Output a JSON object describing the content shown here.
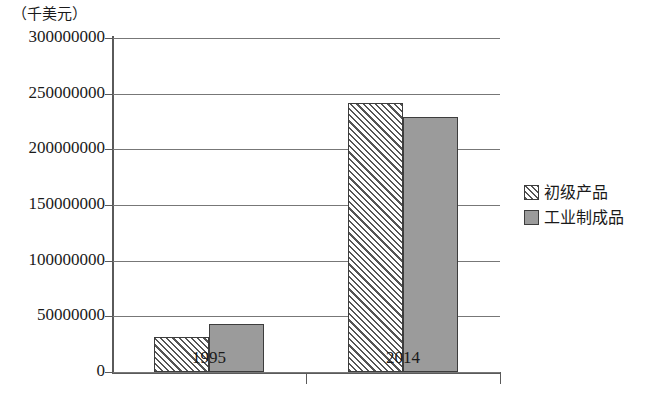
{
  "chart_data": {
    "type": "bar",
    "title": "",
    "subtitle": "",
    "unit_caption": "（千美元）",
    "xlabel": "",
    "ylabel": "",
    "categories": [
      "1995",
      "2014"
    ],
    "series": [
      {
        "name": "初级产品",
        "fill": "hatch-diagonal",
        "values": [
          31000000,
          242000000
        ]
      },
      {
        "name": "工业制成品",
        "fill": "solid-gray",
        "values": [
          43000000,
          229000000
        ]
      }
    ],
    "ylim": [
      0,
      300000000
    ],
    "ytick_values": [
      0,
      50000000,
      100000000,
      150000000,
      200000000,
      250000000,
      300000000
    ],
    "ytick_labels": [
      "0",
      "50000000",
      "100000000",
      "150000000",
      "200000000",
      "250000000",
      "300000000"
    ],
    "grid": true,
    "grid_axis": "y",
    "legend_position": "right",
    "colors": {
      "hatch_line": "#555555",
      "hatch_background": "#ffffff",
      "solid_fill": "#9b9b9b",
      "bar_border": "#3d3d3d",
      "gridline": "#777777",
      "axis": "#5a5a5a",
      "text": "#1a1a1a",
      "background": "#ffffff"
    }
  }
}
